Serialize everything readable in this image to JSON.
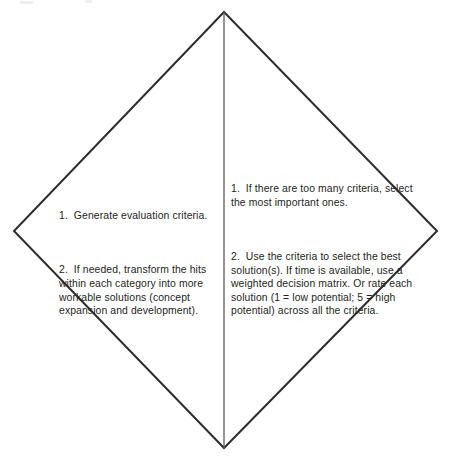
{
  "diagram": {
    "type": "diamond-two-panel",
    "shape_name": "diamond",
    "colors": {
      "outline": "#2f2c2d",
      "divider": "#5b585a",
      "text": "#231f20",
      "background": "#ffffff"
    },
    "geometry": {
      "top_vertex": [
        224,
        12
      ],
      "right_vertex": [
        437,
        231
      ],
      "bottom_vertex": [
        224,
        448
      ],
      "left_vertex": [
        14,
        231
      ],
      "divider_x": 224,
      "outline_width": 2,
      "divider_width": 1.3
    },
    "left_panel": {
      "name": "left-half",
      "items": [
        "1.  Generate evaluation criteria.",
        "2.  If needed, transform the hits within each category into more workable solutions (concept expansion and development)."
      ]
    },
    "right_panel": {
      "name": "right-half",
      "items": [
        "1.  If there are too many criteria, select the most important ones.",
        "2.  Use the criteria to select the best solution(s). If time is available, use a weighted decision matrix. Or rate each solution (1 = low potential; 5 = high potential) across all the criteria."
      ]
    }
  }
}
